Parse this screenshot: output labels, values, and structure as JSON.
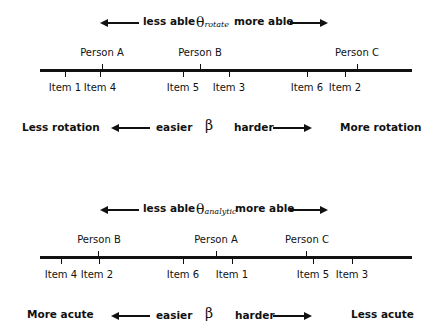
{
  "diagrams": [
    {
      "theta_symbol": "θ",
      "theta_subscript": "rotate",
      "less_able": "less able",
      "more_able": "more able",
      "persons": [
        {
          "label": "Person A",
          "x": 102
        },
        {
          "label": "Person B",
          "x": 200
        },
        {
          "label": "Person C",
          "x": 357
        }
      ],
      "items": [
        {
          "label": "Item 1",
          "x": 65
        },
        {
          "label": "Item 4",
          "x": 100
        },
        {
          "label": "Item 5",
          "x": 183
        },
        {
          "label": "Item 3",
          "x": 229
        },
        {
          "label": "Item 6",
          "x": 307
        },
        {
          "label": "Item 2",
          "x": 345
        }
      ],
      "beta_symbol": "β",
      "easier": "easier",
      "harder": "harder",
      "left_end": "Less rotation",
      "right_end": "More rotation"
    },
    {
      "theta_symbol": "θ",
      "theta_subscript": "analytic",
      "less_able": "less able",
      "more_able": "more able",
      "persons": [
        {
          "label": "Person B",
          "x": 98
        },
        {
          "label": "Person A",
          "x": 216
        },
        {
          "label": "Person C",
          "x": 306
        }
      ],
      "items": [
        {
          "label": "Item 4",
          "x": 61
        },
        {
          "label": "Item 2",
          "x": 99
        },
        {
          "label": "Item 6",
          "x": 183
        },
        {
          "label": "Item 1",
          "x": 232
        },
        {
          "label": "Item 5",
          "x": 313
        },
        {
          "label": "Item 3",
          "x": 352
        }
      ],
      "beta_symbol": "β",
      "easier": "easier",
      "harder": "harder",
      "left_end": "More acute",
      "right_end": "Less acute"
    }
  ]
}
